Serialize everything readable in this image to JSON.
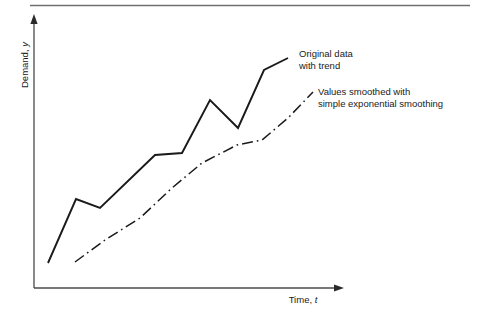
{
  "figure": {
    "top_rule": true,
    "background_color": "#ffffff",
    "ink_color": "#1a1a1a",
    "rule_color": "#6f6f6f"
  },
  "axes": {
    "y_label_text": "Demand, ",
    "y_label_var": "y",
    "x_label_text": "Time, ",
    "x_label_var": "t",
    "y_arrow": "arrow-up-icon",
    "x_arrow": "arrow-right-icon"
  },
  "annotations": [
    {
      "id": "original-data",
      "line1": "Original data",
      "line2": "with trend",
      "x": 299,
      "y1": 57,
      "y2": 69
    },
    {
      "id": "smoothed-values",
      "line1": "Values smoothed with",
      "line2": "simple exponential smoothing",
      "x": 318,
      "y1": 95,
      "y2": 107
    }
  ],
  "chart_data": {
    "type": "line",
    "title": "",
    "xlabel": "Time, t",
    "ylabel": "Demand, y",
    "grid": false,
    "legend_position": "inline-annotations",
    "axis_style": "arrow-axes-no-ticks",
    "xlim": [
      0,
      1
    ],
    "ylim": [
      0,
      1
    ],
    "series": [
      {
        "name": "Original data with trend",
        "style": "solid",
        "color": "#1a1a1a",
        "width": 1.9,
        "points_px": [
          [
            48,
            263
          ],
          [
            76,
            199
          ],
          [
            100,
            208
          ],
          [
            155,
            155
          ],
          [
            182,
            153
          ],
          [
            210,
            100
          ],
          [
            238,
            128
          ],
          [
            264,
            70
          ],
          [
            288,
            58
          ]
        ],
        "x": [
          0.045,
          0.135,
          0.213,
          0.391,
          0.478,
          0.568,
          0.659,
          0.743,
          0.821
        ],
        "values": [
          0.092,
          0.328,
          0.295,
          0.49,
          0.498,
          0.693,
          0.59,
          0.804,
          0.848
        ]
      },
      {
        "name": "Values smoothed with simple exponential smoothing",
        "style": "dash-dot",
        "color": "#1a1a1a",
        "width": 1.5,
        "points_px": [
          [
            75,
            262
          ],
          [
            105,
            240
          ],
          [
            140,
            218
          ],
          [
            172,
            188
          ],
          [
            202,
            163
          ],
          [
            237,
            145
          ],
          [
            262,
            140
          ],
          [
            288,
            118
          ],
          [
            313,
            92
          ]
        ],
        "x": [
          0.132,
          0.229,
          0.342,
          0.446,
          0.542,
          0.655,
          0.736,
          0.821,
          0.901
        ],
        "values": [
          0.096,
          0.177,
          0.258,
          0.369,
          0.461,
          0.528,
          0.546,
          0.627,
          0.723
        ]
      }
    ]
  }
}
